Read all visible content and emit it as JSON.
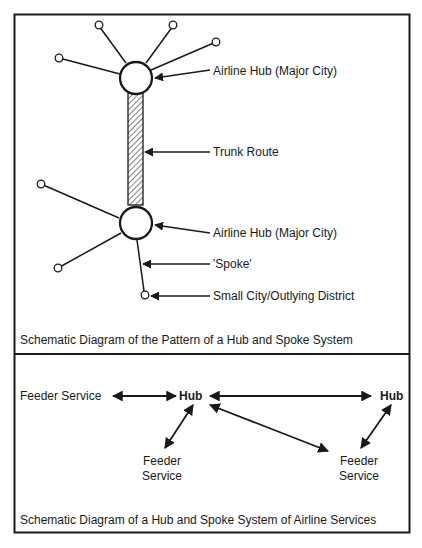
{
  "top_panel": {
    "caption": "Schematic Diagram of the Pattern of a Hub and Spoke System",
    "labels": {
      "hub_upper": "Airline Hub (Major City)",
      "trunk_route": "Trunk Route",
      "hub_lower": "Airline Hub (Major City)",
      "spoke": "'Spoke'",
      "small_city": "Small City/Outlying District"
    }
  },
  "bottom_panel": {
    "caption": "Schematic Diagram of a Hub and Spoke System of Airline Services",
    "feeder_left": "Feeder Service",
    "hub_left": "Hub",
    "hub_right": "Hub",
    "feeder_mid_line1": "Feeder",
    "feeder_mid_line2": "Service",
    "feeder_right_line1": "Feeder",
    "feeder_right_line2": "Service"
  },
  "colors": {
    "ink": "#1a1a1a",
    "background": "#ffffff"
  }
}
